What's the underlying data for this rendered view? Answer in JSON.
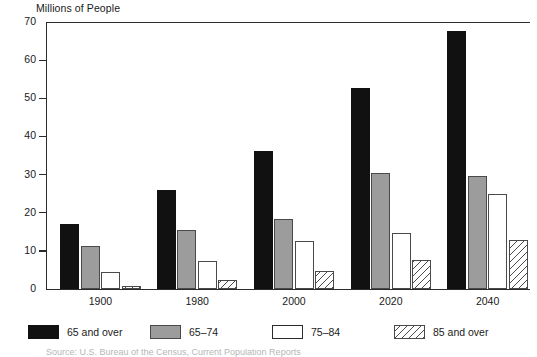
{
  "chart_data": {
    "type": "bar",
    "title": "Millions of People",
    "xlabel": "",
    "ylabel": "Millions of People",
    "categories": [
      "1900",
      "1980",
      "2000",
      "2020",
      "2040"
    ],
    "series": [
      {
        "name": "65 and over",
        "color": "#111111",
        "fill": "solid-black",
        "values": [
          17.1,
          25.9,
          36.2,
          52.6,
          67.6
        ]
      },
      {
        "name": "65–74",
        "color": "#9c9c9c",
        "fill": "solid-gray",
        "values": [
          11.3,
          15.4,
          18.3,
          30.3,
          29.6
        ]
      },
      {
        "name": "75–84",
        "color": "#ffffff",
        "fill": "open-white",
        "values": [
          4.5,
          7.4,
          12.5,
          14.8,
          25.0
        ]
      },
      {
        "name": "85 and over",
        "color": "#4a4a4a",
        "fill": "diagonal-hatch",
        "values": [
          0.8,
          2.3,
          4.6,
          7.5,
          12.9
        ]
      }
    ],
    "ylim": [
      0,
      70
    ],
    "yticks": [
      "0",
      "10",
      "20",
      "30",
      "40",
      "50",
      "60",
      "70"
    ],
    "grid": false,
    "legend_position": "bottom"
  },
  "legend": {
    "items": [
      {
        "label": "65 and over"
      },
      {
        "label": "65–74"
      },
      {
        "label": "75–84"
      },
      {
        "label": "85 and over"
      }
    ]
  },
  "footer": {
    "text": "Source: U.S. Bureau of the Census, Current Population Reports"
  }
}
